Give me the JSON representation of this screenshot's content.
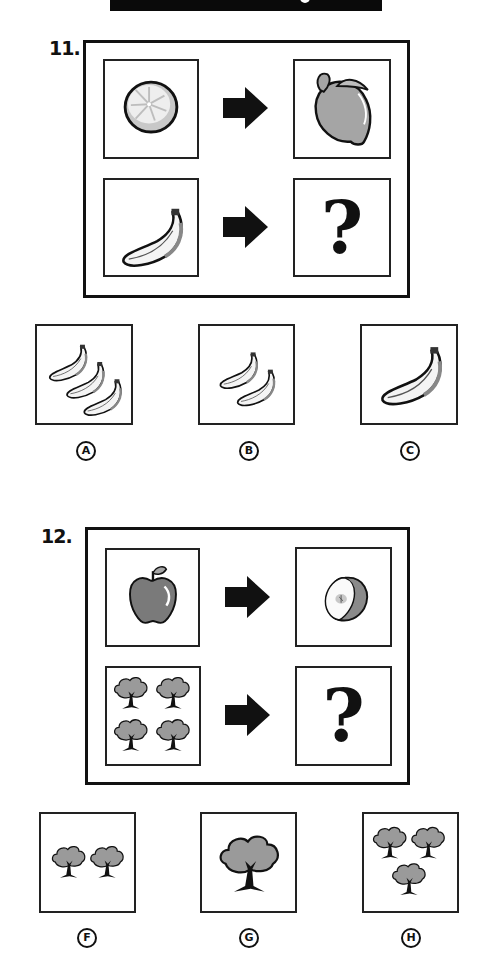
{
  "page": {
    "header_bar": "",
    "colors": {
      "ink": "#111111",
      "fill_gray": "#9a9a9a",
      "background": "#ffffff"
    }
  },
  "questions": [
    {
      "number": "11.",
      "analogy": {
        "top_left": {
          "icon": "grapefruit-half-icon",
          "label": "sliced citrus"
        },
        "arrow": "arrow-right-icon",
        "top_right": {
          "icon": "lemon-icon",
          "label": "whole lemon"
        },
        "bottom_left": {
          "icon": "banana-icon",
          "label": "one banana"
        },
        "bottom_right": {
          "text": "?"
        }
      },
      "options": [
        {
          "letter": "A",
          "icon": "three-bananas-icon"
        },
        {
          "letter": "B",
          "icon": "two-bananas-icon"
        },
        {
          "letter": "C",
          "icon": "large-banana-icon"
        }
      ]
    },
    {
      "number": "12.",
      "analogy": {
        "top_left": {
          "icon": "apple-icon",
          "label": "whole apple"
        },
        "arrow": "arrow-right-icon",
        "top_right": {
          "icon": "apple-half-icon",
          "label": "apple half"
        },
        "bottom_left": {
          "icon": "four-trees-icon",
          "label": "four trees"
        },
        "bottom_right": {
          "text": "?"
        }
      },
      "options": [
        {
          "letter": "F",
          "icon": "two-trees-icon"
        },
        {
          "letter": "G",
          "icon": "large-tree-icon"
        },
        {
          "letter": "H",
          "icon": "three-trees-icon"
        }
      ]
    }
  ]
}
